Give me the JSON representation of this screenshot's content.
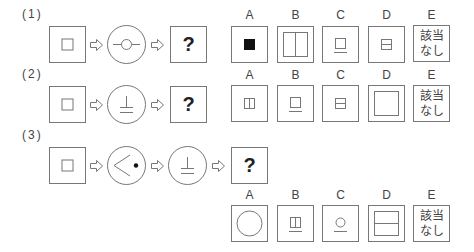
{
  "questions": [
    {
      "label": "(1)",
      "sequence": [
        "small-square",
        "circle-with-line-through-small-circle",
        "?"
      ],
      "question_mark": "?",
      "options": [
        {
          "letter": "A",
          "shape": "filled-small-square"
        },
        {
          "letter": "B",
          "shape": "large-square-vertical-divider"
        },
        {
          "letter": "C",
          "shape": "small-square-with-underline"
        },
        {
          "letter": "D",
          "shape": "small-square-horizontal-divider"
        },
        {
          "letter": "E",
          "text": "該当なし",
          "line1": "該当",
          "line2": "なし"
        }
      ]
    },
    {
      "label": "(2)",
      "sequence": [
        "small-square",
        "circle-with-inverted-t-underline",
        "?"
      ],
      "question_mark": "?",
      "options": [
        {
          "letter": "A",
          "shape": "small-square-vertical-divider"
        },
        {
          "letter": "B",
          "shape": "small-square-with-underline"
        },
        {
          "letter": "C",
          "shape": "small-square-horizontal-divider"
        },
        {
          "letter": "D",
          "shape": "large-square"
        },
        {
          "letter": "E",
          "text": "該当なし",
          "line1": "該当",
          "line2": "なし"
        }
      ]
    },
    {
      "label": "(3)",
      "sequence": [
        "small-square",
        "circle-with-angle-and-dot",
        "circle-with-inverted-t-underline",
        "?"
      ],
      "question_mark": "?",
      "options": [
        {
          "letter": "A",
          "shape": "large-circle"
        },
        {
          "letter": "B",
          "shape": "small-square-vertical-divider-with-underline"
        },
        {
          "letter": "C",
          "shape": "small-circle-with-underline"
        },
        {
          "letter": "D",
          "shape": "large-square-horizontal-divider"
        },
        {
          "letter": "E",
          "text": "該当なし",
          "line1": "該当",
          "line2": "なし"
        }
      ]
    }
  ],
  "colors": {
    "stroke": "#777777",
    "text": "#444444",
    "fill": "#111111"
  }
}
